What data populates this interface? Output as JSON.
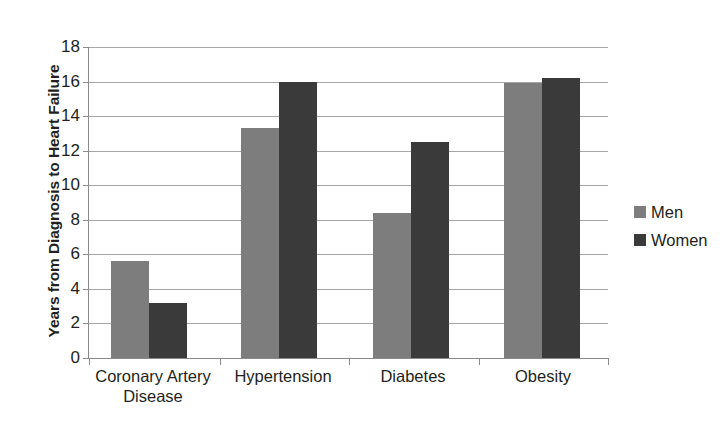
{
  "chart_data": {
    "type": "bar",
    "title": "",
    "xlabel": "",
    "ylabel": "Years from Diagnosis to Heart Failure",
    "ylim": [
      0,
      18
    ],
    "ytick_step": 2,
    "yticks": [
      18,
      16,
      14,
      12,
      10,
      8,
      6,
      4,
      2,
      0
    ],
    "grid": true,
    "legend_position": "right",
    "categories": [
      "Coronary Artery Disease",
      "Hypertension",
      "Diabetes",
      "Obesity"
    ],
    "category_lines": [
      [
        "Coronary Artery",
        "Disease"
      ],
      [
        "Hypertension"
      ],
      [
        "Diabetes"
      ],
      [
        "Obesity"
      ]
    ],
    "series": [
      {
        "name": "Men",
        "color": "#7d7d7d",
        "values": [
          5.6,
          13.3,
          8.4,
          15.9
        ]
      },
      {
        "name": "Women",
        "color": "#3a3a3a",
        "values": [
          3.2,
          16.0,
          12.5,
          16.2
        ]
      }
    ]
  },
  "legend": {
    "items": [
      {
        "label": "Men",
        "color": "#7d7d7d"
      },
      {
        "label": "Women",
        "color": "#3a3a3a"
      }
    ]
  },
  "axis": {
    "y_title": "Years from Diagnosis to Heart Failure",
    "y_labels": [
      "18",
      "16",
      "14",
      "12",
      "10",
      "8",
      "6",
      "4",
      "2",
      "0"
    ]
  }
}
